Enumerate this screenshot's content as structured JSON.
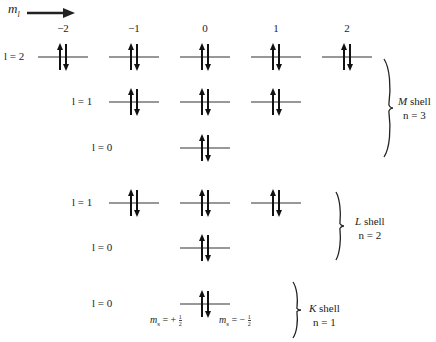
{
  "axis": {
    "label": "m",
    "label_sub": "l",
    "arrow_direction": "right"
  },
  "column_headers": [
    "−2",
    "−1",
    "0",
    "1",
    "2"
  ],
  "rows": [
    {
      "shell": "M",
      "label": "l = 2",
      "l": 2,
      "orbitals": [
        -2,
        -1,
        0,
        1,
        2
      ],
      "electrons_per_orbital": 2
    },
    {
      "shell": "M",
      "label": "l = 1",
      "l": 1,
      "orbitals": [
        -1,
        0,
        1
      ],
      "electrons_per_orbital": 2
    },
    {
      "shell": "M",
      "label": "l = 0",
      "l": 0,
      "orbitals": [
        0
      ],
      "electrons_per_orbital": 2
    },
    {
      "shell": "L",
      "label": "l = 1",
      "l": 1,
      "orbitals": [
        -1,
        0,
        1
      ],
      "electrons_per_orbital": 2
    },
    {
      "shell": "L",
      "label": "l = 0",
      "l": 0,
      "orbitals": [
        0
      ],
      "electrons_per_orbital": 2
    },
    {
      "shell": "K",
      "label": "l = 0",
      "l": 0,
      "orbitals": [
        0
      ],
      "electrons_per_orbital": 2
    }
  ],
  "shells": [
    {
      "name": "M",
      "word": "shell",
      "n_label": "n = 3"
    },
    {
      "name": "L",
      "word": "shell",
      "n_label": "n = 2"
    },
    {
      "name": "K",
      "word": "shell",
      "n_label": "n = 1"
    }
  ],
  "spin_labels": {
    "up": {
      "prefix": "m",
      "sub": "s",
      "eq": "= +",
      "num": "1",
      "den": "2"
    },
    "down": {
      "prefix": "m",
      "sub": "s",
      "eq": "= −",
      "num": "1",
      "den": "2"
    }
  },
  "colors": {
    "ink": "#222222",
    "background": "#ffffff"
  }
}
